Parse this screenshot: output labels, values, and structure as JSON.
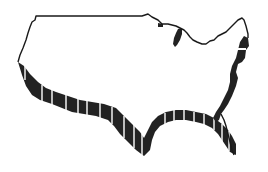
{
  "map": {
    "subject": "Contiguous United States outline",
    "style": "black-and-white line illustration with extruded striped shadow along southern and western edges",
    "colors": {
      "background": "#ffffff",
      "outline": "#1a1a1a",
      "extrusion": "#222222",
      "stripe": "#ffffff",
      "land": "#ffffff"
    },
    "features": [
      {
        "name": "northern-border",
        "label": "Northern border"
      },
      {
        "name": "great-lakes",
        "label": "Great Lakes"
      },
      {
        "name": "west-coast",
        "label": "West coast"
      },
      {
        "name": "gulf-coast",
        "label": "Gulf coast"
      },
      {
        "name": "florida",
        "label": "Florida peninsula"
      },
      {
        "name": "east-coast",
        "label": "East coast"
      }
    ]
  }
}
